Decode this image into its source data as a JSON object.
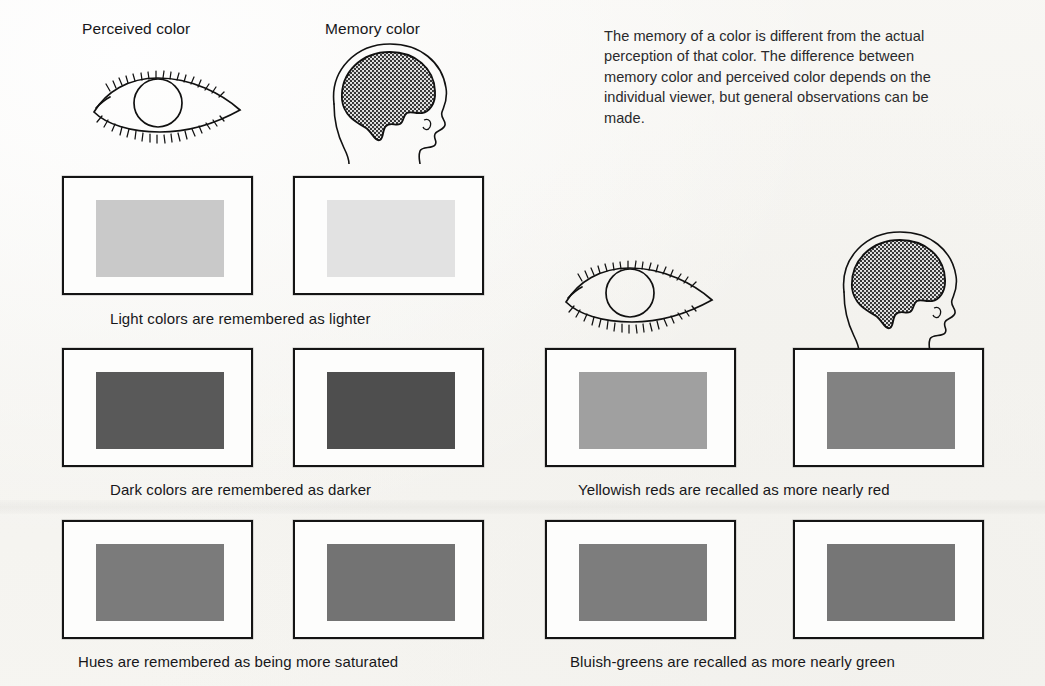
{
  "figure": {
    "background_color": "#f7f6f3",
    "frame_border_color": "#141414"
  },
  "left_panel": {
    "headers": {
      "perceived": "Perceived color",
      "memory": "Memory color"
    },
    "icons": {
      "perceived": "eye-icon",
      "memory": "head-brain-icon"
    },
    "rows": [
      {
        "caption": "Light colors are remembered as lighter",
        "perceived_swatch": "#c9c9c9",
        "memory_swatch": "#e2e2e2"
      },
      {
        "caption": "Dark colors are remembered as darker",
        "perceived_swatch": "#595959",
        "memory_swatch": "#4e4e4e"
      },
      {
        "caption": "Hues are remembered as being more saturated",
        "perceived_swatch": "#7b7b7b",
        "memory_swatch": "#737373"
      }
    ]
  },
  "right_panel": {
    "paragraph": [
      "The memory of a color is different from the actual",
      "perception of that color. The difference between",
      "memory color and perceived color depends on the",
      "individual viewer, but general observations can be",
      "made."
    ],
    "icons": {
      "perceived": "eye-icon",
      "memory": "head-brain-icon"
    },
    "rows": [
      {
        "caption": "Yellowish reds are recalled as more nearly red",
        "perceived_swatch": "#a0a0a0",
        "memory_swatch": "#828282"
      },
      {
        "caption": "Bluish-greens are recalled as more nearly green",
        "perceived_swatch": "#7d7d7d",
        "memory_swatch": "#767676"
      }
    ]
  }
}
